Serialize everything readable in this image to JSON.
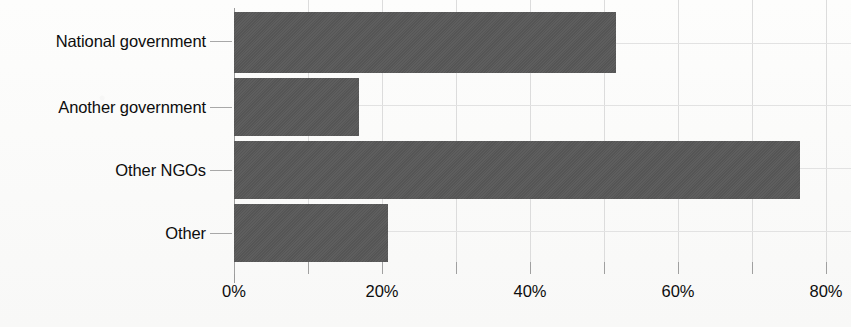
{
  "chart_data": {
    "type": "bar",
    "orientation": "horizontal",
    "title": "",
    "subtitle": "",
    "xlabel": "",
    "ylabel": "",
    "categories": [
      "National government",
      "Another government",
      "Other NGOs",
      "Other"
    ],
    "values": [
      52,
      17,
      77,
      21
    ],
    "value_suffix": "%",
    "xlim": [
      0,
      84
    ],
    "xticks": [
      0,
      20,
      40,
      60,
      80
    ],
    "xtick_labels": [
      "0%",
      "20%",
      "40%",
      "60%",
      "80%"
    ],
    "minor_tick_step": 10,
    "grid": {
      "vertical": true,
      "horizontal": true,
      "color": "#dcdcdc"
    },
    "legend": {
      "present": false,
      "position": "none",
      "entries": []
    },
    "series": [
      {
        "name": "Share of respondents",
        "color": "#585858",
        "values": [
          52,
          17,
          77,
          21
        ]
      }
    ],
    "annotations": []
  },
  "axis": {
    "axis_line_color": "#9a9a9a",
    "tick_color": "#a0a0a0",
    "label_color": "#0d0d0d"
  },
  "icons": {
    "category_tick": "horizontal-tick-dash"
  }
}
